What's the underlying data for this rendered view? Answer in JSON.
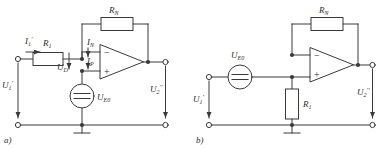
{
  "figure": {
    "circuits": [
      {
        "id": "a",
        "caption": "a)",
        "labels": {
          "input_current": "I",
          "input_current_sub": "1",
          "input_current_prime": "'",
          "resistor_in": "R",
          "resistor_in_sub": "1",
          "resistor_fb": "R",
          "resistor_fb_sub": "N",
          "current_n": "I",
          "current_n_sub": "N",
          "current_p": "I",
          "current_p_sub": "P",
          "diff_voltage": "U",
          "diff_voltage_sub": "D",
          "source": "U",
          "source_sub": "E0",
          "v_in": "U",
          "v_in_sub": "1",
          "v_in_prime": "'",
          "v_out": "U",
          "v_out_sub": "2",
          "v_out_prime": "''",
          "opamp_minus": "−",
          "opamp_plus": "+"
        }
      },
      {
        "id": "b",
        "caption": "b)",
        "labels": {
          "resistor_fb": "R",
          "resistor_fb_sub": "N",
          "resistor_1": "R",
          "resistor_1_sub": "1",
          "source": "U",
          "source_sub": "E0",
          "v_in": "U",
          "v_in_sub": "1",
          "v_in_prime": "'",
          "v_out": "U",
          "v_out_sub": "2",
          "v_out_prime": "''",
          "opamp_minus": "−",
          "opamp_plus": "+"
        }
      }
    ],
    "colors": {
      "line": "#3a3a3a",
      "background": "#ffffff",
      "text": "#2b2b2b"
    }
  }
}
